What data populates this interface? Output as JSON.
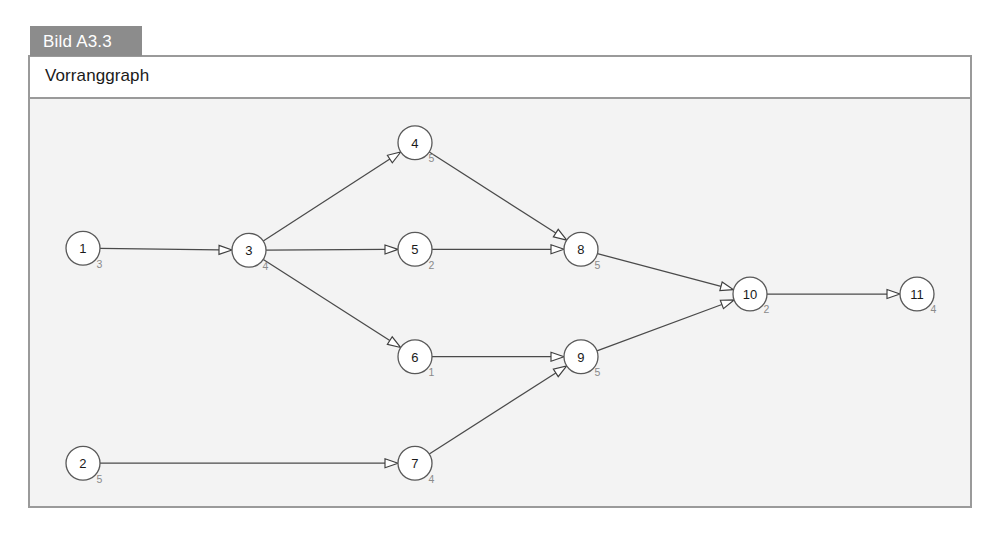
{
  "figure": {
    "tab_label": "Bild A3.3",
    "caption": "Vorranggraph",
    "tab_bg": "#8c8c8c",
    "tab_fg": "#ffffff",
    "frame_border": "#9a9a9a",
    "plate_bg": "#f3f3f3"
  },
  "chart_data": {
    "type": "diagram",
    "subtype": "precedence-graph",
    "title": "Vorranggraph",
    "node_label_key": "id",
    "node_value_key": "duration",
    "nodes": [
      {
        "id": "1",
        "duration": "3",
        "x": 53,
        "y": 150
      },
      {
        "id": "2",
        "duration": "5",
        "x": 53,
        "y": 366
      },
      {
        "id": "3",
        "duration": "4",
        "x": 219,
        "y": 152
      },
      {
        "id": "4",
        "duration": "5",
        "x": 385,
        "y": 44
      },
      {
        "id": "5",
        "duration": "2",
        "x": 385,
        "y": 151
      },
      {
        "id": "6",
        "duration": "1",
        "x": 385,
        "y": 259
      },
      {
        "id": "7",
        "duration": "4",
        "x": 385,
        "y": 366
      },
      {
        "id": "8",
        "duration": "5",
        "x": 551,
        "y": 151
      },
      {
        "id": "9",
        "duration": "5",
        "x": 551,
        "y": 259
      },
      {
        "id": "10",
        "duration": "2",
        "x": 720,
        "y": 196
      },
      {
        "id": "11",
        "duration": "4",
        "x": 887,
        "y": 196
      }
    ],
    "edges": [
      {
        "from": "1",
        "to": "3"
      },
      {
        "from": "3",
        "to": "4"
      },
      {
        "from": "3",
        "to": "5"
      },
      {
        "from": "3",
        "to": "6"
      },
      {
        "from": "4",
        "to": "8"
      },
      {
        "from": "5",
        "to": "8"
      },
      {
        "from": "6",
        "to": "9"
      },
      {
        "from": "2",
        "to": "7"
      },
      {
        "from": "7",
        "to": "9"
      },
      {
        "from": "8",
        "to": "10"
      },
      {
        "from": "9",
        "to": "10"
      },
      {
        "from": "10",
        "to": "11"
      }
    ],
    "node_radius": 17,
    "edge_color": "#4a4a4a",
    "node_stroke": "#595959",
    "node_fill": "#ffffff",
    "duration_color": "#8a8a8a"
  }
}
